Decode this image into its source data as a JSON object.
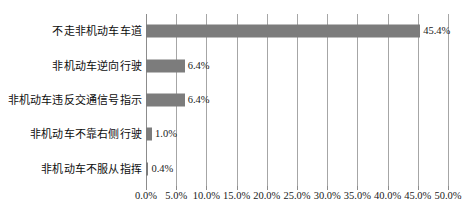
{
  "chart_data": {
    "type": "bar",
    "orientation": "horizontal",
    "title": "",
    "xlabel": "",
    "ylabel": "",
    "xlim": [
      0,
      50
    ],
    "grid": true,
    "legend": false,
    "categories": [
      "不走非机动车车道",
      "非机动车逆向行驶",
      "非机动车违反交通信号指示",
      "非机动车不靠右侧行驶",
      "非机动车不服从指挥"
    ],
    "values": [
      45.4,
      6.4,
      6.4,
      1.0,
      0.4
    ],
    "value_labels": [
      "45.4%",
      "6.4%",
      "6.4%",
      "1.0%",
      "0.4%"
    ],
    "xticks": [
      0,
      5,
      10,
      15,
      20,
      25,
      30,
      35,
      40,
      45,
      50
    ],
    "xtick_labels": [
      "0.0%",
      "5.0%",
      "10.0%",
      "15.0%",
      "20.0%",
      "25.0%",
      "30.0%",
      "35.0%",
      "40.0%",
      "45.0%",
      "50.0%"
    ],
    "bar_color": "#7c7c7c",
    "grid_color": "#a6a6a6",
    "background_color": "#ffffff",
    "text_color": "#1a1a1a"
  }
}
